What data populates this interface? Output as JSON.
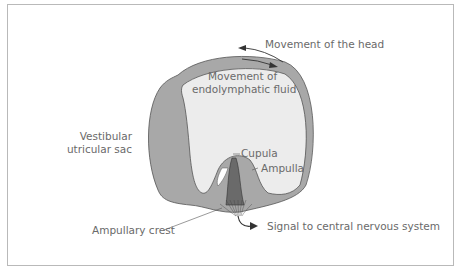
{
  "diagram": {
    "labels": {
      "movement_head": "Movement of the head",
      "movement_fluid_line1": "Movement of",
      "movement_fluid_line2": "endolymphatic fluid",
      "vestibular_line1": "Vestibular",
      "vestibular_line2": "utricular sac",
      "cupula": "Cupula",
      "ampulla": "Ampulla",
      "ampullary_crest": "Ampullary crest",
      "signal": "Signal to central nervous system"
    },
    "colors": {
      "sac_fill": "#a8a8a8",
      "fluid_fill": "#ececec",
      "outline": "#555555",
      "text": "#6a6a6a",
      "arrow": "#333333"
    }
  }
}
